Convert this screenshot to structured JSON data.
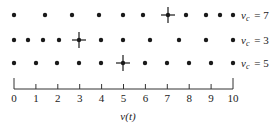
{
  "diagram": {
    "rows": [
      {
        "label_var": "v",
        "label_sub": "c",
        "label_value": "= 7",
        "vc": 7,
        "y": 15,
        "dots_x": [
          14,
          45,
          72,
          99,
          123,
          143,
          186,
          206,
          220,
          233
        ],
        "cross_x": 168
      },
      {
        "label_var": "v",
        "label_sub": "c",
        "label_value": "= 3",
        "vc": 3,
        "y": 40,
        "dots_x": [
          14,
          28,
          43,
          59,
          101,
          123,
          150,
          179,
          206,
          233
        ],
        "cross_x": 79
      },
      {
        "label_var": "v",
        "label_sub": "c",
        "label_value": "= 5",
        "vc": 5,
        "y": 63,
        "dots_x": [
          14,
          36,
          57,
          79,
          101,
          145,
          167,
          189,
          211,
          233
        ],
        "cross_x": 123
      }
    ],
    "axis": {
      "ticks": [
        "0",
        "1",
        "2",
        "3",
        "4",
        "5",
        "6",
        "7",
        "8",
        "9",
        "10"
      ],
      "x_start": 14,
      "x_end": 233,
      "y": 89,
      "title": "v(t)"
    }
  }
}
